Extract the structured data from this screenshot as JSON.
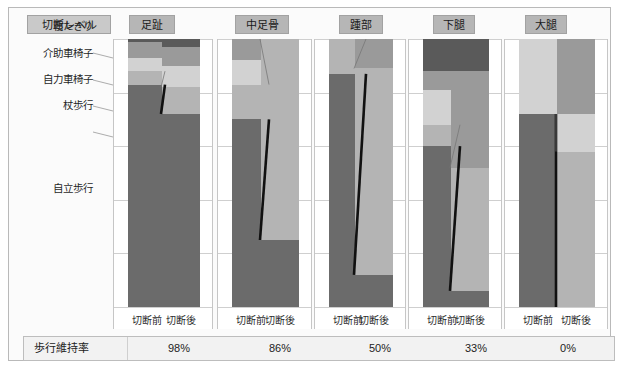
{
  "chart_data": {
    "type": "bar",
    "xlabel": "",
    "ylabel": "歩行レベル",
    "ylim": [
      0,
      100
    ],
    "grid": true,
    "legend_position": "left-inline",
    "stack_order_bottom_to_top": [
      "自立歩行",
      "杖歩行",
      "自力車椅子",
      "介助車椅子",
      "寝たきり"
    ],
    "categories": [
      "切断前",
      "切断後"
    ],
    "groups": [
      "足趾",
      "中足骨",
      "踵部",
      "下腿",
      "大腿"
    ],
    "series": [
      {
        "name": "自立歩行",
        "color": "#6b6b6b"
      },
      {
        "name": "杖歩行",
        "color": "#b4b4b4"
      },
      {
        "name": "自力車椅子",
        "color": "#d2d2d2"
      },
      {
        "name": "介助車椅子",
        "color": "#9a9a9a"
      },
      {
        "name": "寝たきり",
        "color": "#5a5a5a"
      }
    ],
    "panels": [
      {
        "group": "足趾",
        "walking_retention": "98%",
        "before": {
          "自立歩行": 83,
          "杖歩行": 5,
          "自力車椅子": 5,
          "介助車椅子": 6,
          "寝たきり": 1
        },
        "after": {
          "自立歩行": 72,
          "杖歩行": 10,
          "自力車椅子": 8,
          "介助車椅子": 7,
          "寝たきり": 3
        }
      },
      {
        "group": "中足骨",
        "walking_retention": "86%",
        "before": {
          "自立歩行": 70,
          "杖歩行": 13,
          "自力車椅子": 9,
          "介助車椅子": 8,
          "寝たきり": 0
        },
        "after": {
          "自立歩行": 25,
          "杖歩行": 75,
          "自力車椅子": 0,
          "介助車椅子": 0,
          "寝たきり": 0
        }
      },
      {
        "group": "踵部",
        "walking_retention": "50%",
        "before": {
          "自立歩行": 87,
          "杖歩行": 13,
          "自力車椅子": 0,
          "介助車椅子": 0,
          "寝たきり": 0
        },
        "after": {
          "自立歩行": 12,
          "杖歩行": 77,
          "自力車椅子": 0,
          "介助車椅子": 11,
          "寝たきり": 0
        }
      },
      {
        "group": "下腿",
        "walking_retention": "33%",
        "before": {
          "自立歩行": 60,
          "杖歩行": 8,
          "自力車椅子": 13,
          "介助車椅子": 7,
          "寝たきり": 12
        },
        "after": {
          "自立歩行": 6,
          "杖歩行": 46,
          "自力車椅子": 0,
          "介助車椅子": 36,
          "寝たきり": 12
        }
      },
      {
        "group": "大腿",
        "walking_retention": "0%",
        "before": {
          "自立歩行": 72,
          "杖歩行": 0,
          "自力車椅子": 28,
          "介助車椅子": 0,
          "寝たきり": 0
        },
        "after": {
          "自立歩行": 0,
          "杖歩行": 58,
          "自力車椅子": 14,
          "介助車椅子": 28,
          "寝たきり": 0
        }
      }
    ]
  },
  "header": {
    "level_label": "切断レベル",
    "groups": [
      "足趾",
      "中足骨",
      "踵部",
      "下腿",
      "大腿"
    ]
  },
  "axis": {
    "category_labels": [
      "寝たきり",
      "介助車椅子",
      "自力車椅子",
      "杖歩行",
      "自立歩行"
    ],
    "tick_labels": [
      "切断前",
      "切断後"
    ]
  },
  "footer": {
    "label": "歩行維持率",
    "values": [
      "98%",
      "86%",
      "50%",
      "33%",
      "0%"
    ]
  },
  "colors": {
    "independent_walk": "#6b6b6b",
    "cane_walk": "#b4b4b4",
    "self_wheelchair": "#d2d2d2",
    "assisted_wheelchair": "#9a9a9a",
    "bedridden": "#5a5a5a",
    "chip_bg": "#b6b6b6",
    "panel_border": "#c6c6c6",
    "footer_bg": "#f2f2f2"
  }
}
